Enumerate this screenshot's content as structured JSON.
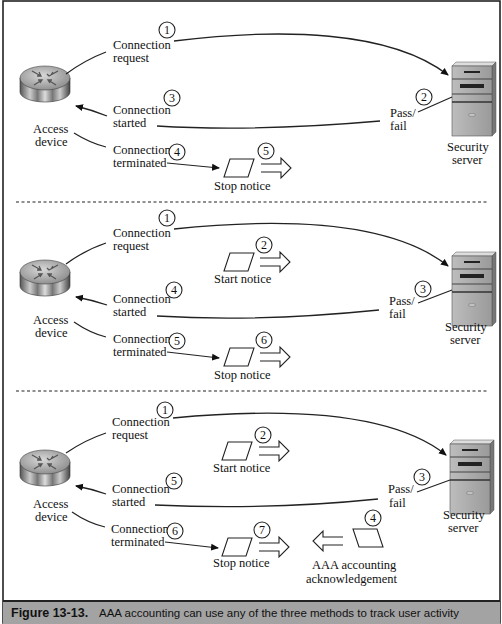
{
  "panels": [
    {
      "device_label": [
        "Access",
        "device"
      ],
      "server_label": [
        "Security",
        "server"
      ],
      "request": {
        "num": "1",
        "label": [
          "Connection",
          "request"
        ]
      },
      "passfail": {
        "num": "2",
        "label": [
          "Pass/",
          "fail"
        ]
      },
      "started": {
        "num": "3",
        "label": [
          "Connection",
          "started"
        ]
      },
      "terminated": {
        "num": "4",
        "label": [
          "Connection",
          "terminated"
        ]
      },
      "stop": {
        "num": "5",
        "label": "Stop notice"
      }
    },
    {
      "device_label": [
        "Access",
        "device"
      ],
      "server_label": [
        "Security",
        "server"
      ],
      "request": {
        "num": "1",
        "label": [
          "Connection",
          "request"
        ]
      },
      "start": {
        "num": "2",
        "label": "Start notice"
      },
      "passfail": {
        "num": "3",
        "label": [
          "Pass/",
          "fail"
        ]
      },
      "started": {
        "num": "4",
        "label": [
          "Connection",
          "started"
        ]
      },
      "terminated": {
        "num": "5",
        "label": [
          "Connection",
          "terminated"
        ]
      },
      "stop": {
        "num": "6",
        "label": "Stop notice"
      }
    },
    {
      "device_label": [
        "Access",
        "device"
      ],
      "server_label": [
        "Security",
        "server"
      ],
      "request": {
        "num": "1",
        "label": [
          "Connection",
          "request"
        ]
      },
      "start": {
        "num": "2",
        "label": "Start notice"
      },
      "passfail": {
        "num": "3",
        "label": [
          "Pass/",
          "fail"
        ]
      },
      "ack": {
        "num": "4",
        "label": [
          "AAA accounting",
          "acknowledgement"
        ]
      },
      "started": {
        "num": "5",
        "label": [
          "Connection",
          "started"
        ]
      },
      "terminated": {
        "num": "6",
        "label": [
          "Connection",
          "terminated"
        ]
      },
      "stop": {
        "num": "7",
        "label": "Stop notice"
      }
    }
  ],
  "icons": {
    "device": "router-icon",
    "server": "server-tower-icon",
    "notice": "notice-parallelogram-icon",
    "send": "double-arrow-right-icon",
    "receive": "double-arrow-left-icon"
  },
  "caption": {
    "figure": "Figure 13-13.",
    "text": "AAA accounting can use any of the three methods to track user activity",
    "bar_color": "#a3a3a3"
  }
}
